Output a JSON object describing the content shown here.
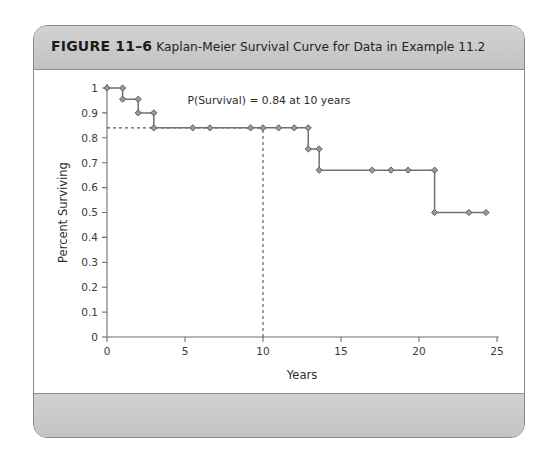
{
  "figure": {
    "number_label": "FIGURE 11–6",
    "caption": "Kaplan-Meier Survival Curve for Data in Example 11.2"
  },
  "chart_data": {
    "type": "line",
    "subtype": "kaplan-meier-step",
    "title": "",
    "xlabel": "Years",
    "ylabel": "Percent Surviving",
    "xlim": [
      0,
      25
    ],
    "ylim": [
      0,
      1
    ],
    "xticks": [
      0,
      5,
      10,
      15,
      20,
      25
    ],
    "xticklabels": [
      "0",
      "5",
      "10",
      "15",
      "20",
      "25"
    ],
    "yticks": [
      0,
      0.1,
      0.2,
      0.3,
      0.4,
      0.5,
      0.6,
      0.7,
      0.8,
      0.9,
      1
    ],
    "yticklabels": [
      "0",
      "0.1",
      "0.2",
      "0.3",
      "0.4",
      "0.5",
      "0.6",
      "0.7",
      "0.8",
      "0.9",
      "1"
    ],
    "grid": false,
    "legend": false,
    "series": [
      {
        "name": "Survival",
        "x": [
          0,
          1,
          1,
          2,
          2,
          3,
          3,
          3.4,
          5.5,
          6.6,
          9.2,
          10,
          11,
          12,
          12.9,
          12.9,
          13.6,
          13.6,
          14.1,
          14.1,
          17,
          18.2,
          19.3,
          21,
          21,
          23.2,
          24.3
        ],
        "y": [
          1,
          1,
          0.955,
          0.955,
          0.9,
          0.9,
          0.84,
          0.84,
          0.84,
          0.84,
          0.84,
          0.84,
          0.84,
          0.84,
          0.84,
          0.755,
          0.755,
          0.67,
          0.67,
          0.67,
          0.67,
          0.67,
          0.67,
          0.67,
          0.5,
          0.5,
          0.5
        ]
      }
    ],
    "markers": [
      {
        "x": 0,
        "y": 1
      },
      {
        "x": 1,
        "y": 1
      },
      {
        "x": 1,
        "y": 0.955
      },
      {
        "x": 2,
        "y": 0.955
      },
      {
        "x": 2,
        "y": 0.9
      },
      {
        "x": 3,
        "y": 0.9
      },
      {
        "x": 3,
        "y": 0.84
      },
      {
        "x": 5.5,
        "y": 0.84
      },
      {
        "x": 6.6,
        "y": 0.84
      },
      {
        "x": 9.2,
        "y": 0.84
      },
      {
        "x": 10,
        "y": 0.84
      },
      {
        "x": 11,
        "y": 0.84
      },
      {
        "x": 12,
        "y": 0.84
      },
      {
        "x": 12.9,
        "y": 0.84
      },
      {
        "x": 12.9,
        "y": 0.755
      },
      {
        "x": 13.6,
        "y": 0.755
      },
      {
        "x": 13.6,
        "y": 0.67
      },
      {
        "x": 17,
        "y": 0.67
      },
      {
        "x": 18.2,
        "y": 0.67
      },
      {
        "x": 19.3,
        "y": 0.67
      },
      {
        "x": 21,
        "y": 0.67
      },
      {
        "x": 21,
        "y": 0.5
      },
      {
        "x": 23.2,
        "y": 0.5
      },
      {
        "x": 24.3,
        "y": 0.5
      }
    ],
    "annotations": [
      {
        "text": "P(Survival) = 0.84 at 10 years",
        "x": 10,
        "y": 0.84
      }
    ],
    "reference_lines": [
      {
        "orientation": "horizontal",
        "value": 0.84,
        "from": 0,
        "to": 10,
        "style": "dashed"
      },
      {
        "orientation": "vertical",
        "value": 10,
        "from": 0,
        "to": 0.84,
        "style": "dashed"
      }
    ],
    "colors": {
      "line": "#70706f",
      "marker_fill": "#9a9a9a",
      "marker_stroke": "#5e5e5e",
      "axis": "#6e6e6e",
      "guide": "#5d5d5d",
      "header_band": "#cacaca",
      "frame": "#8a8a8a"
    }
  }
}
